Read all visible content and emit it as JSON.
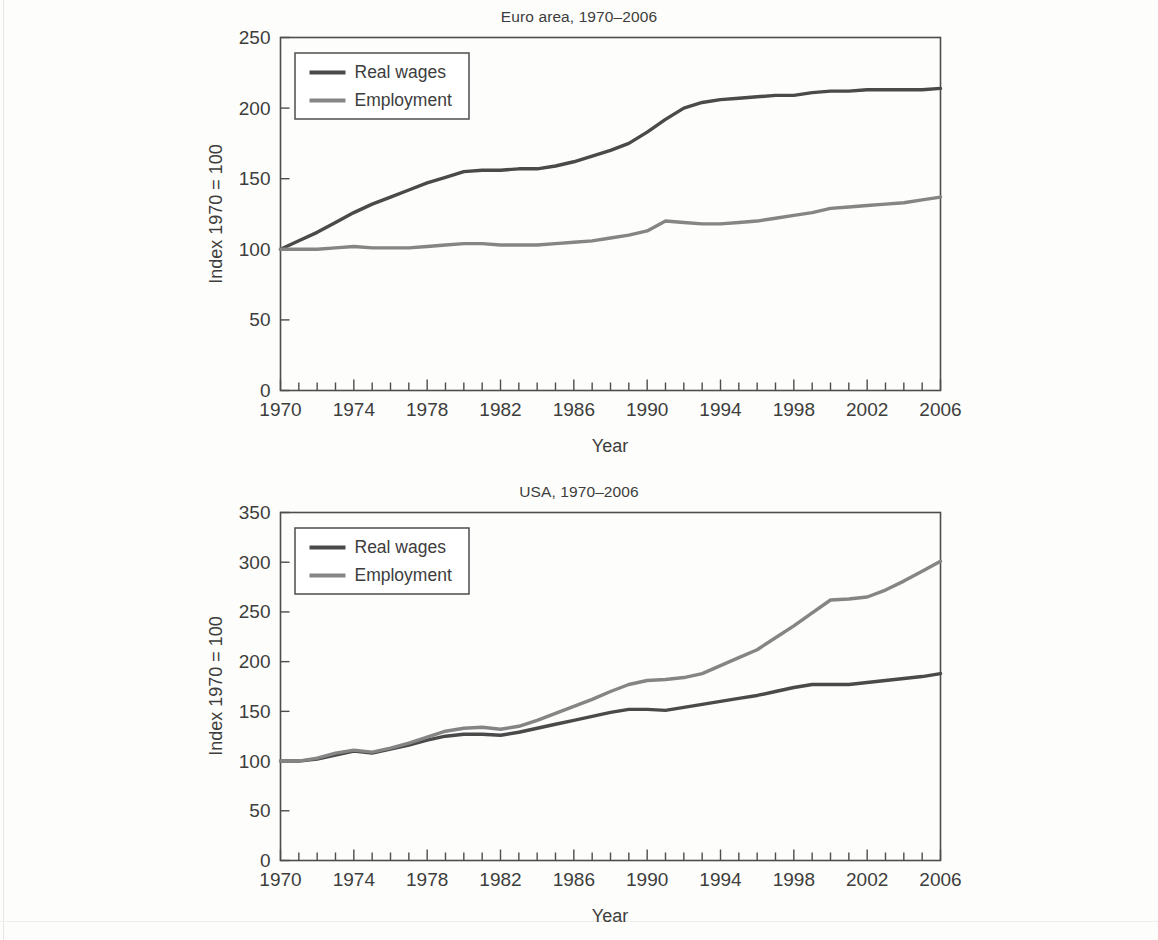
{
  "figure": {
    "background_color": "#fdfdfb",
    "axis_color": "#4d4d4d",
    "text_color": "#3d3d3d"
  },
  "panels": [
    {
      "id": "euro-area",
      "title": "Euro area, 1970–2006",
      "ylabel": "Index 1970 = 100",
      "xlabel": "Year",
      "ytick_labels": [
        "0",
        "50",
        "100",
        "150",
        "200",
        "250"
      ],
      "xtick_labels": [
        "1970",
        "1974",
        "1978",
        "1982",
        "1986",
        "1990",
        "1994",
        "1998",
        "2002",
        "2006"
      ],
      "legend": [
        {
          "label": "Real wages",
          "color": "#4a4a4a"
        },
        {
          "label": "Employment",
          "color": "#858585"
        }
      ]
    },
    {
      "id": "usa",
      "title": "USA, 1970–2006",
      "ylabel": "Index 1970 = 100",
      "xlabel": "Year",
      "ytick_labels": [
        "0",
        "50",
        "100",
        "150",
        "200",
        "250",
        "300",
        "350"
      ],
      "xtick_labels": [
        "1970",
        "1974",
        "1978",
        "1982",
        "1986",
        "1990",
        "1994",
        "1998",
        "2002",
        "2006"
      ],
      "legend": [
        {
          "label": "Real wages",
          "color": "#4a4a4a"
        },
        {
          "label": "Employment",
          "color": "#858585"
        }
      ]
    }
  ],
  "chart_data": [
    {
      "type": "line",
      "title": "Euro area, 1970–2006",
      "xlabel": "Year",
      "ylabel": "Index 1970 = 100",
      "xlim": [
        1970,
        2006
      ],
      "ylim": [
        0,
        250
      ],
      "yticks": [
        0,
        50,
        100,
        150,
        200,
        250
      ],
      "xticks": [
        1970,
        1974,
        1978,
        1982,
        1986,
        1990,
        1994,
        1998,
        2002,
        2006
      ],
      "xtick_interval_minor": 1,
      "grid": false,
      "legend_position": "upper left",
      "x": [
        1970,
        1971,
        1972,
        1973,
        1974,
        1975,
        1976,
        1977,
        1978,
        1979,
        1980,
        1981,
        1982,
        1983,
        1984,
        1985,
        1986,
        1987,
        1988,
        1989,
        1990,
        1991,
        1992,
        1993,
        1994,
        1995,
        1996,
        1997,
        1998,
        1999,
        2000,
        2001,
        2002,
        2003,
        2004,
        2005,
        2006
      ],
      "series": [
        {
          "name": "Real wages",
          "color": "#4a4a4a",
          "values": [
            100,
            106,
            112,
            119,
            126,
            132,
            137,
            142,
            147,
            151,
            155,
            156,
            156,
            157,
            157,
            159,
            162,
            166,
            170,
            175,
            183,
            192,
            200,
            204,
            206,
            207,
            208,
            209,
            209,
            211,
            212,
            212,
            213,
            213,
            213,
            213,
            214
          ]
        },
        {
          "name": "Employment",
          "color": "#858585",
          "values": [
            100,
            100,
            100,
            101,
            102,
            101,
            101,
            101,
            102,
            103,
            104,
            104,
            103,
            103,
            103,
            104,
            105,
            106,
            108,
            110,
            113,
            120,
            119,
            118,
            118,
            119,
            120,
            122,
            124,
            126,
            129,
            130,
            131,
            132,
            133,
            135,
            137
          ]
        }
      ]
    },
    {
      "type": "line",
      "title": "USA, 1970–2006",
      "xlabel": "Year",
      "ylabel": "Index 1970 = 100",
      "xlim": [
        1970,
        2006
      ],
      "ylim": [
        0,
        350
      ],
      "yticks": [
        0,
        50,
        100,
        150,
        200,
        250,
        300,
        350
      ],
      "xticks": [
        1970,
        1974,
        1978,
        1982,
        1986,
        1990,
        1994,
        1998,
        2002,
        2006
      ],
      "xtick_interval_minor": 1,
      "grid": false,
      "legend_position": "upper left",
      "x": [
        1970,
        1971,
        1972,
        1973,
        1974,
        1975,
        1976,
        1977,
        1978,
        1979,
        1980,
        1981,
        1982,
        1983,
        1984,
        1985,
        1986,
        1987,
        1988,
        1989,
        1990,
        1991,
        1992,
        1993,
        1994,
        1995,
        1996,
        1997,
        1998,
        1999,
        2000,
        2001,
        2002,
        2003,
        2004,
        2005,
        2006
      ],
      "series": [
        {
          "name": "Real wages",
          "color": "#4a4a4a",
          "values": [
            100,
            100,
            102,
            106,
            110,
            108,
            112,
            116,
            121,
            125,
            127,
            127,
            126,
            129,
            133,
            137,
            141,
            145,
            149,
            152,
            152,
            151,
            154,
            157,
            160,
            163,
            166,
            170,
            174,
            177,
            177,
            177,
            179,
            181,
            183,
            185,
            188
          ]
        },
        {
          "name": "Employment",
          "color": "#858585",
          "values": [
            100,
            100,
            103,
            108,
            111,
            109,
            113,
            118,
            124,
            130,
            133,
            134,
            132,
            135,
            141,
            148,
            155,
            162,
            170,
            177,
            181,
            182,
            184,
            188,
            196,
            204,
            212,
            224,
            236,
            249,
            262,
            263,
            265,
            272,
            281,
            291,
            301
          ]
        }
      ]
    }
  ]
}
